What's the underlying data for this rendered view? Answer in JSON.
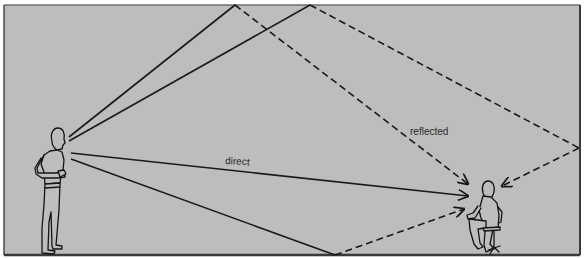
{
  "diagram": {
    "type": "sound-propagation",
    "room": {
      "background": "#bdbdbd",
      "border": "#3a3a3a",
      "top_edge": "#6f6f6f"
    },
    "colors": {
      "line": "#1a1a1a",
      "figure_stroke": "#141414",
      "figure_fill": "#bdbdbd"
    },
    "labels": {
      "direct": "direct",
      "reflected": "reflected"
    },
    "nodes": [
      {
        "id": "speaker",
        "label": "standing person (speaker)"
      },
      {
        "id": "listener",
        "label": "seated person (listener)"
      }
    ],
    "paths": [
      {
        "id": "ceiling-reflection-1",
        "style": "solid-then-dashed",
        "reflect_point": "ceiling"
      },
      {
        "id": "ceiling-reflection-2",
        "style": "solid-then-dashed",
        "reflect_points": [
          "ceiling",
          "right wall"
        ]
      },
      {
        "id": "direct-path",
        "style": "solid",
        "label": "direct"
      },
      {
        "id": "floor-reflection",
        "style": "solid-then-dashed",
        "reflect_point": "floor"
      }
    ]
  }
}
